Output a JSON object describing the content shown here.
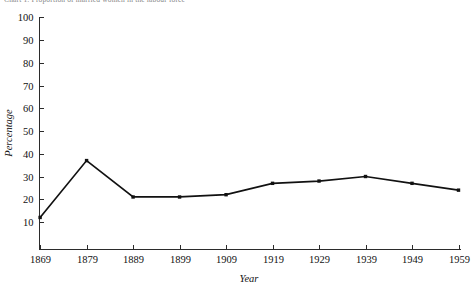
{
  "caption": {
    "text": "Chart 1:  Proportion of married women in the labour force"
  },
  "chart_data": {
    "type": "line",
    "title": "",
    "xlabel": "Year",
    "ylabel": "Percentage",
    "categories": [
      "1869",
      "1879",
      "1889",
      "1899",
      "1909",
      "1919",
      "1929",
      "1939",
      "1949",
      "1959"
    ],
    "x": [
      1869,
      1879,
      1889,
      1899,
      1909,
      1919,
      1929,
      1939,
      1949,
      1959
    ],
    "values": [
      12,
      37,
      21,
      21,
      22,
      27,
      28,
      30,
      27,
      24
    ],
    "series": [
      {
        "name": "Percentage",
        "values": [
          12,
          37,
          21,
          21,
          22,
          27,
          28,
          30,
          27,
          24
        ]
      }
    ],
    "ylim": [
      0,
      100
    ],
    "yticks": [
      10,
      20,
      30,
      40,
      50,
      60,
      70,
      80,
      90,
      100
    ],
    "ytick_labels": [
      "10",
      "20",
      "30",
      "40",
      "50",
      "60",
      "70",
      "80",
      "90",
      "100"
    ],
    "xticks": [
      1869,
      1879,
      1889,
      1899,
      1909,
      1919,
      1929,
      1939,
      1949,
      1959
    ],
    "xtick_labels": [
      "1869",
      "1879",
      "1889",
      "1899",
      "1909",
      "1919",
      "1929",
      "1939",
      "1949",
      "1959"
    ],
    "grid": false,
    "legend": false,
    "legend_position": "none",
    "marker": "dot",
    "line_color": "#111111",
    "background_color": "#ffffff"
  }
}
